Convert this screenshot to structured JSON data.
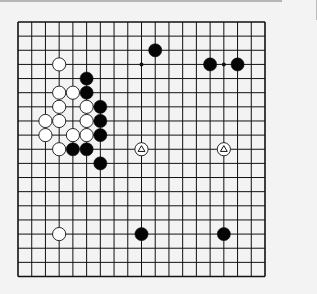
{
  "game": {
    "type": "go",
    "board_size": 19,
    "colors": {
      "line": "#111111",
      "black_stone": "#050505",
      "white_stone": "#ffffff",
      "background": "#f3f3f3"
    },
    "hoshi": [
      "D16",
      "K16",
      "Q16",
      "D10",
      "K10",
      "Q10",
      "D4",
      "K4",
      "Q4"
    ],
    "stones": [
      {
        "color": "white",
        "point": "D16"
      },
      {
        "color": "black",
        "point": "F15"
      },
      {
        "color": "white",
        "point": "D14"
      },
      {
        "color": "white",
        "point": "E14"
      },
      {
        "color": "black",
        "point": "F14"
      },
      {
        "color": "white",
        "point": "D13"
      },
      {
        "color": "white",
        "point": "F13"
      },
      {
        "color": "black",
        "point": "G13"
      },
      {
        "color": "white",
        "point": "C12"
      },
      {
        "color": "white",
        "point": "D12"
      },
      {
        "color": "white",
        "point": "F12"
      },
      {
        "color": "black",
        "point": "G12"
      },
      {
        "color": "white",
        "point": "C11"
      },
      {
        "color": "white",
        "point": "E11"
      },
      {
        "color": "white",
        "point": "F11"
      },
      {
        "color": "black",
        "point": "G11"
      },
      {
        "color": "white",
        "point": "D10"
      },
      {
        "color": "black",
        "point": "E10"
      },
      {
        "color": "black",
        "point": "F10"
      },
      {
        "color": "black",
        "point": "G9"
      },
      {
        "color": "black",
        "point": "L17"
      },
      {
        "color": "black",
        "point": "P16"
      },
      {
        "color": "black",
        "point": "R16"
      },
      {
        "color": "white",
        "point": "K10",
        "marker": "triangle"
      },
      {
        "color": "white",
        "point": "Q10",
        "marker": "triangle"
      },
      {
        "color": "white",
        "point": "D4"
      },
      {
        "color": "black",
        "point": "K4"
      },
      {
        "color": "black",
        "point": "Q4"
      }
    ]
  }
}
